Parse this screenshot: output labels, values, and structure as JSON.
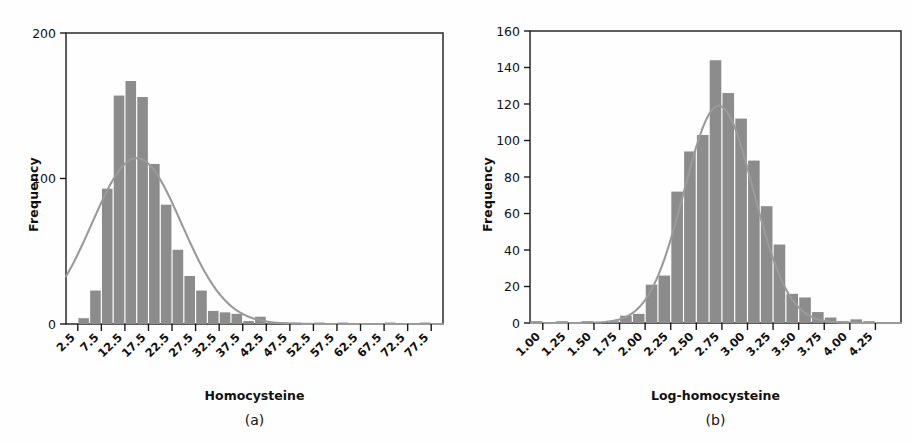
{
  "figure": {
    "width": 912,
    "height": 445,
    "background": "#fefefe",
    "bar_color": "#8c8c8c",
    "curve_color": "#9a9a9a",
    "axis_color": "#1a1a1a"
  },
  "panels": [
    {
      "caption": "(a)",
      "ylabel": "Frequency",
      "xlabel": "Homocysteine"
    },
    {
      "caption": "(b)",
      "ylabel": "Frequency",
      "xlabel": "Log-homocysteine"
    }
  ],
  "chart_data": [
    {
      "type": "bar",
      "title": "",
      "subtitle": "(a)",
      "xlabel": "Homocysteine",
      "ylabel": "Frequency",
      "grid": false,
      "legend": "none",
      "overlay": "normal density curve",
      "xlim": [
        0,
        80
      ],
      "ylim": [
        0,
        200
      ],
      "yticks": [
        0,
        100,
        200
      ],
      "ytick_labels": [
        "0",
        "100",
        "200"
      ],
      "xticks": [
        2.5,
        7.5,
        12.5,
        17.5,
        22.5,
        27.5,
        32.5,
        37.5,
        42.5,
        47.5,
        52.5,
        57.5,
        62.5,
        67.5,
        72.5,
        77.5
      ],
      "xtick_labels": [
        "2.5",
        "7.5",
        "12.5",
        "17.5",
        "22.5",
        "27.5",
        "32.5",
        "37.5",
        "42.5",
        "47.5",
        "52.5",
        "57.5",
        "62.5",
        "67.5",
        "72.5",
        "77.5"
      ],
      "bin_width": 2.5,
      "categories": [
        1.25,
        3.75,
        6.25,
        8.75,
        11.25,
        13.75,
        16.25,
        18.75,
        21.25,
        23.75,
        26.25,
        28.75,
        31.25,
        33.75,
        36.25,
        38.75,
        41.25,
        43.75,
        46.25,
        48.75,
        51.25,
        53.75,
        56.25,
        58.75,
        61.25,
        63.75,
        66.25,
        68.75,
        71.25,
        73.75,
        76.25,
        78.75
      ],
      "values": [
        0,
        4,
        23,
        93,
        157,
        167,
        156,
        110,
        82,
        51,
        33,
        23,
        9,
        8,
        7,
        2,
        5,
        1,
        1,
        1,
        0,
        1,
        0,
        1,
        0,
        0,
        0,
        1,
        0,
        0,
        1,
        0
      ],
      "curve": {
        "name": "normal density",
        "mean": 15.0,
        "sd": 9.5,
        "peak_value": 114,
        "color": "#9a9a9a"
      }
    },
    {
      "type": "bar",
      "title": "",
      "subtitle": "(b)",
      "xlabel": "Log-homocysteine",
      "ylabel": "Frequency",
      "grid": false,
      "legend": "none",
      "overlay": "normal density curve",
      "xlim": [
        0.875,
        4.5
      ],
      "ylim": [
        0,
        160
      ],
      "yticks": [
        0,
        20,
        40,
        60,
        80,
        100,
        120,
        140,
        160
      ],
      "ytick_labels": [
        "0",
        "20",
        "40",
        "60",
        "80",
        "100",
        "120",
        "140",
        "160"
      ],
      "xticks": [
        1.0,
        1.25,
        1.5,
        1.75,
        2.0,
        2.25,
        2.5,
        2.75,
        3.0,
        3.25,
        3.5,
        3.75,
        4.0,
        4.25
      ],
      "xtick_labels": [
        "1.00",
        "1.25",
        "1.50",
        "1.75",
        "2.00",
        "2.25",
        "2.50",
        "2.75",
        "3.00",
        "3.25",
        "3.50",
        "3.75",
        "4.00",
        "4.25"
      ],
      "bin_width": 0.125,
      "categories": [
        0.9375,
        1.0625,
        1.1875,
        1.3125,
        1.4375,
        1.5625,
        1.6875,
        1.8125,
        1.9375,
        2.0625,
        2.1875,
        2.3125,
        2.4375,
        2.5625,
        2.6875,
        2.8125,
        2.9375,
        3.0625,
        3.1875,
        3.3125,
        3.4375,
        3.5625,
        3.6875,
        3.8125,
        3.9375,
        4.0625,
        4.1875,
        4.3125
      ],
      "values": [
        1,
        0,
        1,
        0,
        1,
        0,
        1,
        4,
        5,
        21,
        26,
        72,
        94,
        103,
        144,
        126,
        112,
        89,
        64,
        43,
        16,
        14,
        6,
        3,
        1,
        2,
        1,
        0
      ],
      "curve": {
        "name": "normal density",
        "mean": 2.72,
        "sd": 0.34,
        "peak_value": 119,
        "color": "#9a9a9a"
      }
    }
  ]
}
